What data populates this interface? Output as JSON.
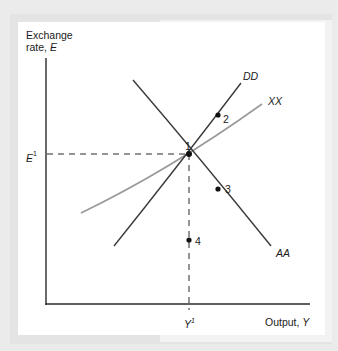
{
  "figure": {
    "y_axis_label_line1": "Exchange",
    "y_axis_label_line2": "rate, ",
    "y_axis_symbol": "E",
    "x_axis_label": "Output, ",
    "x_axis_symbol": "Y",
    "y_tick_label": "E",
    "y_tick_superscript": "1",
    "x_tick_label": "Y",
    "x_tick_superscript": "1"
  },
  "curves": [
    {
      "id": "DD",
      "label": "DD",
      "color": "#3a3a3a",
      "from": [
        114,
        246
      ],
      "to": [
        241,
        83
      ]
    },
    {
      "id": "XX",
      "label": "XX",
      "color": "#9a9a9a",
      "from": [
        81,
        213
      ],
      "to": [
        262,
        104
      ]
    },
    {
      "id": "AA",
      "label": "AA",
      "color": "#3a3a3a",
      "from": [
        133,
        80
      ],
      "to": [
        271,
        246
      ]
    }
  ],
  "points": [
    {
      "id": "1",
      "label": "1",
      "x": 189,
      "y": 154
    },
    {
      "id": "2",
      "label": "2",
      "x": 218,
      "y": 115
    },
    {
      "id": "3",
      "label": "3",
      "x": 218,
      "y": 189
    },
    {
      "id": "4",
      "label": "4",
      "x": 189,
      "y": 240
    }
  ],
  "colors": {
    "background": "#ebebeb",
    "panel": "#ffffff",
    "axis": "#2a2a2a",
    "dark_curve": "#3a3a3a",
    "light_curve": "#9a9a9a"
  }
}
